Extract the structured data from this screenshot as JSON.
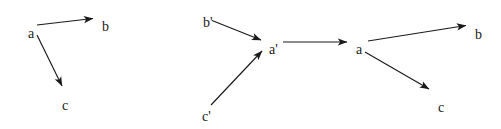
{
  "figure": {
    "type": "diagram",
    "background_color": "#ffffff",
    "stroke_color": "#1a1a1a",
    "width": 501,
    "height": 129
  },
  "diagrams": [
    {
      "id": "left-diagram",
      "name": "left-graph",
      "nodes": [
        {
          "id": "a",
          "label": "a",
          "x": 28,
          "y": 27
        },
        {
          "id": "b",
          "label": "b",
          "x": 102,
          "y": 20
        },
        {
          "id": "c",
          "label": "c",
          "x": 62,
          "y": 99
        }
      ],
      "edges": [
        {
          "id": "a-to-b",
          "from": "a",
          "to": "b",
          "x1": 37,
          "y1": 25,
          "x2": 93,
          "y2": 18.5
        },
        {
          "id": "a-to-c",
          "from": "a",
          "to": "c",
          "x1": 37,
          "y1": 35,
          "x2": 62,
          "y2": 86
        }
      ]
    },
    {
      "id": "right-diagram",
      "name": "right-graph",
      "nodes": [
        {
          "id": "b-prime",
          "label": "b'",
          "x": 203,
          "y": 16
        },
        {
          "id": "c-prime",
          "label": "c'",
          "x": 202,
          "y": 110
        },
        {
          "id": "a-prime",
          "label": "a'",
          "x": 269,
          "y": 43
        },
        {
          "id": "a",
          "label": "a",
          "x": 356,
          "y": 43
        },
        {
          "id": "b",
          "label": "b",
          "x": 475,
          "y": 28
        },
        {
          "id": "c",
          "label": "c",
          "x": 438,
          "y": 101
        }
      ],
      "edges": [
        {
          "id": "bprime-to-aprime",
          "from": "b-prime",
          "to": "a-prime",
          "x1": 212,
          "y1": 20.5,
          "x2": 261,
          "y2": 40
        },
        {
          "id": "cprime-to-aprime",
          "from": "c-prime",
          "to": "a-prime",
          "x1": 211,
          "y1": 105,
          "x2": 262,
          "y2": 51
        },
        {
          "id": "aprime-to-a",
          "from": "a-prime",
          "to": "a",
          "x1": 283,
          "y1": 42,
          "x2": 347,
          "y2": 42
        },
        {
          "id": "a-to-b",
          "from": "a",
          "to": "b",
          "x1": 368,
          "y1": 41,
          "x2": 466,
          "y2": 25.5
        },
        {
          "id": "a-to-c",
          "from": "a",
          "to": "c",
          "x1": 365,
          "y1": 52,
          "x2": 429,
          "y2": 89
        }
      ]
    }
  ]
}
